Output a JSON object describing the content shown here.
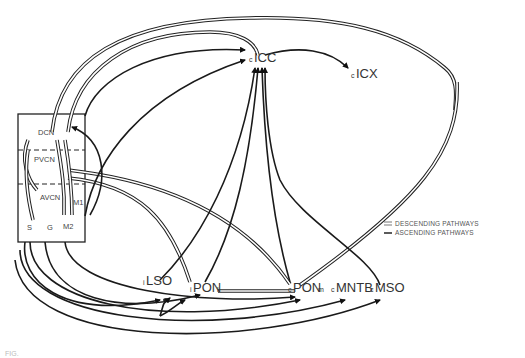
{
  "nuclei": {
    "icc": {
      "prefix": "c",
      "name": "ICC",
      "suffix": ""
    },
    "icx": {
      "prefix": "c",
      "name": "ICX",
      "suffix": ""
    },
    "lso": {
      "prefix": "i",
      "name": "LSO",
      "suffix": ""
    },
    "ponl": {
      "prefix": "i",
      "name": "PON",
      "suffix": "l"
    },
    "ponm": {
      "prefix": "c",
      "name": "PON",
      "suffix": "m"
    },
    "mntb": {
      "prefix": "c",
      "name": "MNTB",
      "suffix": ""
    },
    "mso": {
      "prefix": "c",
      "name": "MSO",
      "suffix": ""
    }
  },
  "cochlear_nucleus": {
    "dcn": "DCN",
    "pvcn": "PVCN",
    "avcn": "AVCN",
    "m1": "M1",
    "m2": "M2",
    "s": "S",
    "g": "G"
  },
  "legend": {
    "descending": "DESCENDING PATHWAYS",
    "ascending": "ASCENDING PATHWAYS"
  },
  "caption": "FIG."
}
